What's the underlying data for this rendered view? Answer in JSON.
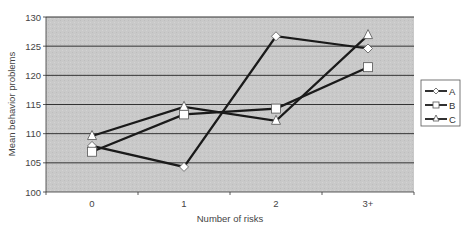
{
  "chart_data": {
    "type": "line",
    "title": "",
    "xlabel": "Number of risks",
    "ylabel": "Mean behavior problems",
    "categories": [
      "0",
      "1",
      "2",
      "3+"
    ],
    "ylim": [
      100,
      130
    ],
    "yticks": [
      100,
      105,
      110,
      115,
      120,
      125,
      130
    ],
    "grid": true,
    "legend_position": "right",
    "series": [
      {
        "name": "A",
        "marker": "diamond",
        "values": [
          107.9,
          104.3,
          126.7,
          124.6
        ]
      },
      {
        "name": "B",
        "marker": "square",
        "values": [
          106.9,
          113.3,
          114.3,
          121.4
        ]
      },
      {
        "name": "C",
        "marker": "triangle",
        "values": [
          109.6,
          114.6,
          112.2,
          126.9
        ]
      }
    ]
  },
  "colors": {
    "plot_background": "#c8c8c8",
    "gridline": "#333333",
    "line": "#1a1a1a",
    "marker_fill": "#ffffff"
  }
}
